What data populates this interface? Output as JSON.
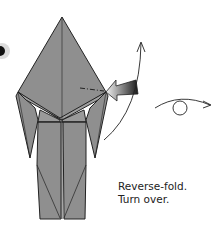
{
  "diagram": {
    "type": "origami-step",
    "colors": {
      "paper": "#8f8f8f",
      "paper_light": "#a6a6a6",
      "outline": "#222222",
      "step_dot": "#111111",
      "arrow_gradient_start": "#f2f2f2",
      "arrow_gradient_end": "#1a1a1a"
    },
    "symbols": [
      "step-marker",
      "reverse-fold-push-arrow",
      "movement-arc-arrow",
      "turn-over-symbol"
    ]
  },
  "caption": {
    "line1": "Reverse-fold.",
    "line2": "Turn over."
  }
}
